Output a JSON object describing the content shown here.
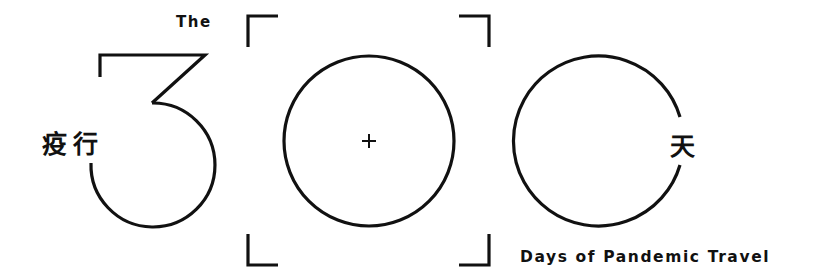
{
  "logo": {
    "prefix": "The",
    "number": "300",
    "chinese_left": "疫行",
    "chinese_right": "天",
    "subtitle": "Days of Pandemic Travel",
    "center_mark": "+"
  },
  "colors": {
    "stroke": "#111111",
    "background": "#ffffff"
  }
}
